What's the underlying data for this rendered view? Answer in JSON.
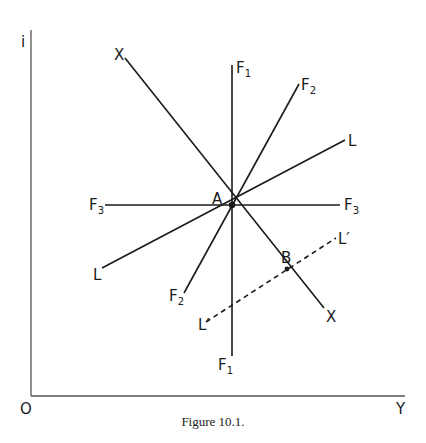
{
  "figure": {
    "caption": "Figure 10.1.",
    "axes": {
      "y_label": "i",
      "x_label": "Y",
      "origin_label": "O"
    },
    "center_point": "A",
    "second_point": "B",
    "lines": [
      {
        "id": "F1",
        "label": "F",
        "sub": "1",
        "style": "solid"
      },
      {
        "id": "F2",
        "label": "F",
        "sub": "2",
        "style": "solid"
      },
      {
        "id": "F3",
        "label": "F",
        "sub": "3",
        "style": "solid"
      },
      {
        "id": "L",
        "label": "L",
        "style": "solid"
      },
      {
        "id": "X",
        "label": "X",
        "style": "solid"
      },
      {
        "id": "L_prime",
        "label": "L′",
        "style": "dashed"
      }
    ]
  }
}
